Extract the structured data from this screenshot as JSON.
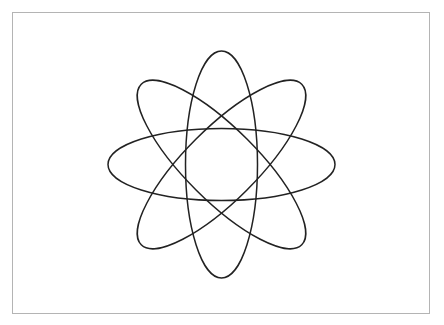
{
  "diagram": {
    "type": "atom-orbits",
    "center": [
      221.5,
      164.5
    ],
    "stroke_color": "#222222",
    "frame_color": "#b4b4b4",
    "background": "#ffffff",
    "orbits": [
      {
        "name": "horizontal",
        "rx": 113.5,
        "ry": 36,
        "rotation": 0
      },
      {
        "name": "vertical",
        "rx": 113.5,
        "ry": 36,
        "rotation": 90
      },
      {
        "name": "diagonal-up",
        "rx": 113.5,
        "ry": 36,
        "rotation": 45
      },
      {
        "name": "diagonal-down",
        "rx": 113.5,
        "ry": 36,
        "rotation": -45
      }
    ]
  }
}
